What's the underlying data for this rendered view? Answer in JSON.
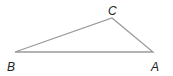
{
  "diagram": {
    "type": "triangle",
    "vertices": [
      {
        "label": "A",
        "x": 153,
        "y": 52
      },
      {
        "label": "B",
        "x": 15,
        "y": 52
      },
      {
        "label": "C",
        "x": 112,
        "y": 18
      }
    ],
    "stroke_color": "#9a9a9a",
    "label_color": "#222222"
  }
}
